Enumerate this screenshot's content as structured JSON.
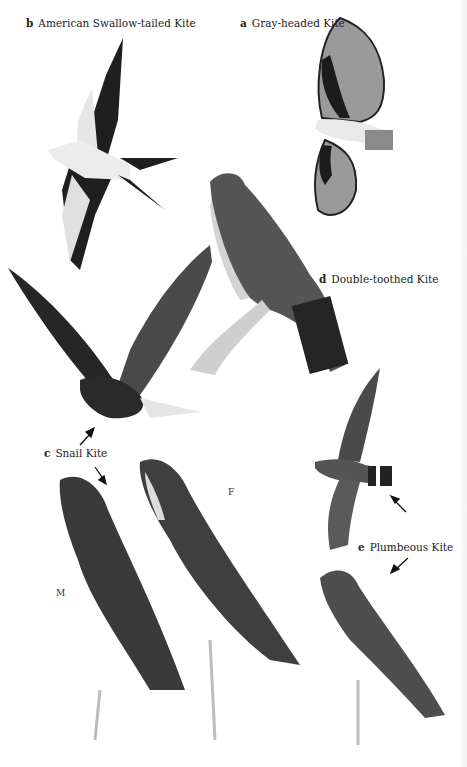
{
  "plate": {
    "background": "#ffffff",
    "species": [
      {
        "letter": "a",
        "name": "Gray-headed Kite"
      },
      {
        "letter": "b",
        "name": "American Swallow-tailed Kite"
      },
      {
        "letter": "c",
        "name": "Snail Kite"
      },
      {
        "letter": "d",
        "name": "Double-toothed Kite"
      },
      {
        "letter": "e",
        "name": "Plumbeous Kite"
      }
    ],
    "sex_labels": {
      "male": "M",
      "female": "F"
    },
    "colors": {
      "ink": "#1a1a1a",
      "dark_plumage": "#2b2b2b",
      "mid_plumage": "#5a5a5a",
      "light_plumage": "#cfcfcf",
      "branch": "#bdbdbd"
    }
  }
}
